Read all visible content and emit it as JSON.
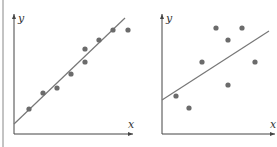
{
  "chart_data": [
    {
      "type": "scatter",
      "title": "",
      "xlabel": "x",
      "ylabel": "y",
      "grid": false,
      "description": "Strong positive linear correlation with fitted line",
      "points": [
        [
          29,
          109
        ],
        [
          43,
          93
        ],
        [
          57,
          88
        ],
        [
          71,
          74
        ],
        [
          85,
          62
        ],
        [
          85,
          49
        ],
        [
          99,
          40
        ],
        [
          113,
          30
        ],
        [
          128,
          30
        ]
      ],
      "fit_line": [
        [
          14,
          124
        ],
        [
          125,
          18
        ]
      ],
      "axes": {
        "origin": [
          14,
          134
        ],
        "x_end": 133,
        "y_end": 14
      }
    },
    {
      "type": "scatter",
      "title": "",
      "xlabel": "x",
      "ylabel": "y",
      "grid": false,
      "description": "Weak positive correlation with fitted line",
      "points": [
        [
          176,
          96
        ],
        [
          189,
          108
        ],
        [
          202,
          62
        ],
        [
          216,
          28
        ],
        [
          228,
          40
        ],
        [
          228,
          85
        ],
        [
          242,
          28
        ],
        [
          255,
          62
        ]
      ],
      "fit_line": [
        [
          162,
          100
        ],
        [
          269,
          31
        ]
      ],
      "axes": {
        "origin": [
          162,
          134
        ],
        "x_end": 275,
        "y_end": 14
      }
    }
  ],
  "colors": {
    "axis": "#444444",
    "point": "#6b6b6b",
    "line": "#777777",
    "border": "#888888"
  }
}
